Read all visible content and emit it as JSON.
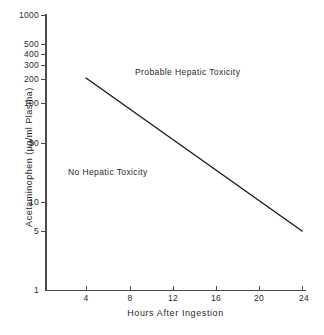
{
  "chart_data": {
    "type": "line",
    "title": "",
    "subtitle": "",
    "xlabel": "Hours After Ingestion",
    "ylabel": "Acetaminophen (µg/ml Plasma)",
    "xlim": [
      0,
      24
    ],
    "ylim": [
      1,
      1000
    ],
    "yscale": "log",
    "xscale": "linear",
    "grid": false,
    "legend": null,
    "xticks": [
      4,
      8,
      12,
      16,
      20,
      24
    ],
    "xticklabels": [
      "4",
      "8",
      "12",
      "16",
      "20",
      "24"
    ],
    "yticks": [
      1,
      5,
      10,
      50,
      100,
      200,
      300,
      400,
      500,
      1000
    ],
    "yticklabels": [
      "1",
      "5",
      "10",
      "50",
      "100",
      "200",
      "300",
      "400",
      "500",
      "1000"
    ],
    "series": [
      {
        "name": "treatment-line",
        "x": [
          4,
          24
        ],
        "y": [
          200,
          5
        ],
        "color": "#1a1a1a"
      }
    ],
    "annotations": [
      {
        "text": "Probable Hepatic Toxicity",
        "x": 12.5,
        "y": 320
      },
      {
        "text": "No Hepatic Toxicity",
        "x": 6.5,
        "y": 21
      }
    ]
  },
  "axes": {
    "y_title": "Acetaminophen (µg/ml Plasma)",
    "x_title": "Hours After Ingestion",
    "y_ticks": [
      {
        "value": 1000,
        "label": "1000",
        "top": 15
      },
      {
        "value": 500,
        "label": "500",
        "top": 44
      },
      {
        "value": 400,
        "label": "400",
        "top": 54
      },
      {
        "value": 300,
        "label": "300",
        "top": 65
      },
      {
        "value": 200,
        "label": "200",
        "top": 79
      },
      {
        "value": 100,
        "label": "100",
        "top": 103
      },
      {
        "value": 50,
        "label": "50",
        "top": 143
      },
      {
        "value": 10,
        "label": "10",
        "top": 202
      },
      {
        "value": 5,
        "label": "5",
        "top": 231
      },
      {
        "value": 1,
        "label": "1",
        "top": 290
      }
    ],
    "x_ticks": [
      {
        "value": 4,
        "label": "4",
        "left": 86
      },
      {
        "value": 8,
        "label": "8",
        "left": 130
      },
      {
        "value": 12,
        "label": "12",
        "left": 173
      },
      {
        "value": 16,
        "label": "16",
        "left": 216
      },
      {
        "value": 20,
        "label": "20",
        "left": 259
      },
      {
        "value": 24,
        "label": "24",
        "left": 302
      }
    ]
  },
  "annotations": {
    "probable_toxicity": "Probable Hepatic Toxicity",
    "no_toxicity": "No Hepatic Toxicity"
  },
  "colors": {
    "axis": "#4a4a4a",
    "line": "#1a1a1a",
    "text": "#1f1f1f",
    "background": "#ffffff"
  },
  "line_geometry": {
    "x1": 86,
    "y1": 78,
    "x2": 302,
    "y2": 231
  }
}
